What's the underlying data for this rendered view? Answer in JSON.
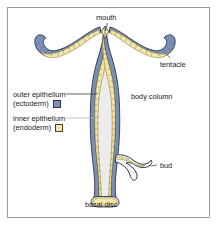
{
  "figure": {
    "colors": {
      "outer_epithelium": "#7b90b8",
      "inner_epithelium": "#f2e6a8",
      "outline": "#2f3642",
      "cavity": "#ececed",
      "frame_border": "#9a9a9a",
      "background": "#ffffff",
      "text": "#1a1a1a",
      "leader_dark": "#3a3a3a",
      "leader_light": "#b5b5b5"
    },
    "labels": {
      "mouth": "mouth",
      "tentacle": "tentacle",
      "body_column": "body column",
      "bud": "bud",
      "basal_disc": "basal disc"
    },
    "legend": {
      "items": [
        {
          "name": "outer epithelium",
          "qualifier": "(ectoderm)",
          "color": "#7b90b8"
        },
        {
          "name": "inner epithelium",
          "qualifier": "(endoderm)",
          "color": "#f2e6a8"
        }
      ]
    }
  }
}
